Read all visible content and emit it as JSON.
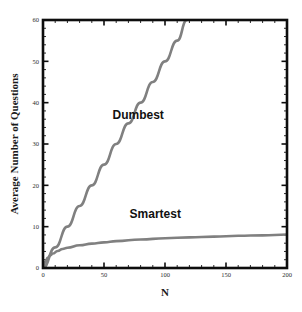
{
  "chart_data": {
    "type": "line",
    "title": "",
    "subtitle": "",
    "xlabel": "N",
    "ylabel": "Average Number of Questions",
    "xlim": [
      0,
      200
    ],
    "ylim": [
      0,
      60
    ],
    "grid": false,
    "legend_position": "inline-annotation",
    "x_ticks": [
      0,
      50,
      100,
      150,
      200
    ],
    "x_tick_labels": [
      "0",
      "50",
      "100",
      "150",
      "200"
    ],
    "x_minor_tick_step": 10,
    "y_ticks": [
      0,
      10,
      20,
      30,
      40,
      50,
      60
    ],
    "y_tick_labels": [
      "0",
      "10",
      "20",
      "30",
      "40",
      "50",
      "60"
    ],
    "y_minor_tick_step": 2,
    "annotations": [
      {
        "text": "Dumbest",
        "x": 78,
        "y": 36
      },
      {
        "text": "Smartest",
        "x": 92,
        "y": 12
      }
    ],
    "series": [
      {
        "name": "Dumbest",
        "color": "#808080",
        "linewidth": 2.6,
        "description": "Linear growth, slope 0.5, clipped at top of plot near N=118",
        "x": [
          0,
          10,
          20,
          30,
          40,
          50,
          60,
          70,
          80,
          90,
          100,
          110,
          118
        ],
        "values": [
          0,
          5,
          10,
          15,
          20,
          25,
          30,
          35,
          40,
          45,
          50,
          55,
          60
        ]
      },
      {
        "name": "Smartest",
        "color": "#808080",
        "linewidth": 2.6,
        "description": "Logarithmic growth, approximately log2(N), reaching about 8 at N=200",
        "x": [
          0,
          1,
          2,
          4,
          6,
          8,
          12,
          16,
          20,
          30,
          40,
          50,
          60,
          80,
          100,
          120,
          140,
          160,
          180,
          200
        ],
        "values": [
          0,
          0.9,
          1.6,
          2.5,
          3.1,
          3.5,
          4.1,
          4.6,
          4.9,
          5.5,
          5.9,
          6.2,
          6.5,
          6.9,
          7.2,
          7.4,
          7.6,
          7.8,
          7.9,
          8.1
        ]
      }
    ]
  },
  "chart": {
    "xlabel": "N",
    "ylabel": "Average Number of Questions",
    "dumbest_label": "Dumbest",
    "smartest_label": "Smartest"
  }
}
